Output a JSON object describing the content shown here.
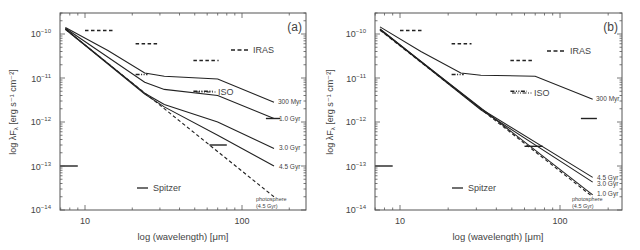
{
  "chart_data": [
    {
      "type": "line",
      "panel_label": "(a)",
      "title": "",
      "xlabel": "log (wavelength) [μm]",
      "ylabel": "log λF_λ [erg s⁻¹ cm⁻²]",
      "xscale": "log",
      "yscale": "log",
      "xlim": [
        6.9,
        256
      ],
      "ylim": [
        1e-14,
        3e-10
      ],
      "x_ticks": [
        {
          "value": 10,
          "label": "10"
        },
        {
          "value": 100,
          "label": "100"
        }
      ],
      "y_ticks": [
        {
          "value": 1e-10,
          "label": "10⁻¹⁰"
        },
        {
          "value": 1e-11,
          "label": "10⁻¹¹"
        },
        {
          "value": 1e-12,
          "label": "10⁻¹²"
        },
        {
          "value": 1e-13,
          "label": "10⁻¹³"
        },
        {
          "value": 1e-14,
          "label": "10⁻¹⁴"
        }
      ],
      "grid": false,
      "series": [
        {
          "name": "300 Myr",
          "style": "solid",
          "x": [
            7.5,
            14,
            24,
            32,
            70,
            160
          ],
          "y": [
            1.4e-10,
            4.2e-11,
            1.3e-11,
            1.1e-11,
            9.5e-12,
            2.8e-12
          ]
        },
        {
          "name": "1.0 Gyr",
          "style": "solid",
          "x": [
            7.5,
            24,
            32,
            70,
            160
          ],
          "y": [
            1.35e-10,
            8e-12,
            5.5e-12,
            4e-12,
            1.2e-12
          ]
        },
        {
          "name": "3.0 Gyr",
          "style": "solid",
          "x": [
            7.5,
            24,
            32,
            70,
            160
          ],
          "y": [
            1.3e-10,
            4.5e-12,
            2.5e-12,
            1e-12,
            2.5e-13
          ]
        },
        {
          "name": "4.5 Gyr",
          "style": "solid",
          "x": [
            7.5,
            24,
            32,
            70,
            160
          ],
          "y": [
            1.28e-10,
            4.3e-12,
            2.2e-12,
            5e-13,
            1e-13
          ]
        },
        {
          "name": "photosphere (4.5 Gyr)",
          "style": "dashed",
          "x": [
            7.5,
            160
          ],
          "y": [
            1.28e-10,
            2e-14
          ]
        }
      ],
      "observations": [
        {
          "instrument": "IRAS",
          "style": "dashed",
          "x_range": [
            10,
            15
          ],
          "y": 1.2e-10
        },
        {
          "instrument": "IRAS",
          "style": "dashed",
          "x_range": [
            21,
            29
          ],
          "y": 6e-11
        },
        {
          "instrument": "IRAS",
          "style": "dashed",
          "x_range": [
            49,
            71
          ],
          "y": 2.5e-11
        },
        {
          "instrument": "ISO",
          "style": "dash-dot-dot",
          "x_range": [
            21,
            25
          ],
          "y": 1.2e-11
        },
        {
          "instrument": "ISO",
          "style": "dash-dot-dot",
          "x_range": [
            49,
            65
          ],
          "y": 5e-12
        },
        {
          "instrument": "Spitzer",
          "style": "solid",
          "x_range": [
            6.9,
            9
          ],
          "y": 1e-13
        },
        {
          "instrument": "Spitzer",
          "style": "solid",
          "x_range": [
            62,
            80
          ],
          "y": 3e-13
        },
        {
          "instrument": "Spitzer",
          "style": "solid",
          "x_range": [
            142,
            175
          ],
          "y": 1.2e-12
        }
      ],
      "legend": [
        {
          "label": "IRAS",
          "style": "dashed"
        },
        {
          "label": "ISO",
          "style": "dash-dot-dot"
        },
        {
          "label": "Spitzer",
          "style": "solid"
        }
      ],
      "curve_labels": [
        "300 Myr",
        "1.0 Gyr",
        "3.0 Gyr",
        "4.5 Gyr",
        "photosphere",
        "(4.5 Gyr)"
      ]
    },
    {
      "type": "line",
      "panel_label": "(b)",
      "title": "",
      "xlabel": "log (wavelength) [μm]",
      "ylabel": "log λF_λ [erg s⁻¹ cm⁻²]",
      "xscale": "log",
      "yscale": "log",
      "xlim": [
        6.9,
        260
      ],
      "ylim": [
        1e-14,
        3e-10
      ],
      "x_ticks": [
        {
          "value": 10,
          "label": "10"
        },
        {
          "value": 100,
          "label": "100"
        }
      ],
      "y_ticks": [
        {
          "value": 1e-10,
          "label": "10⁻¹⁰"
        },
        {
          "value": 1e-11,
          "label": "10⁻¹¹"
        },
        {
          "value": 1e-12,
          "label": "10⁻¹²"
        },
        {
          "value": 1e-13,
          "label": "10⁻¹³"
        },
        {
          "value": 1e-14,
          "label": "10⁻¹⁴"
        }
      ],
      "grid": false,
      "series": [
        {
          "name": "300 Myr",
          "style": "solid",
          "x": [
            7.5,
            13.5,
            24,
            32,
            70,
            160
          ],
          "y": [
            1.45e-10,
            4e-11,
            1.3e-11,
            1.15e-11,
            1.1e-11,
            3.3e-12
          ]
        },
        {
          "name": "4.5 Gyr",
          "style": "solid",
          "x": [
            7.5,
            32,
            160
          ],
          "y": [
            1.3e-10,
            2e-12,
            5.5e-14
          ]
        },
        {
          "name": "3.0 Gyr",
          "style": "solid",
          "x": [
            7.5,
            32,
            160
          ],
          "y": [
            1.28e-10,
            1.9e-12,
            4.3e-14
          ]
        },
        {
          "name": "1.0 Gyr",
          "style": "solid",
          "x": [
            7.5,
            160
          ],
          "y": [
            1.25e-10,
            2.2e-14
          ]
        },
        {
          "name": "photosphere (4.5 Gyr)",
          "style": "dashed",
          "x": [
            7.5,
            160
          ],
          "y": [
            1.22e-10,
            2e-14
          ]
        }
      ],
      "observations": [
        {
          "instrument": "IRAS",
          "style": "dashed",
          "x_range": [
            10,
            14
          ],
          "y": 1.2e-10
        },
        {
          "instrument": "IRAS",
          "style": "dashed",
          "x_range": [
            21,
            28
          ],
          "y": 6e-11
        },
        {
          "instrument": "IRAS",
          "style": "dashed",
          "x_range": [
            49,
            68
          ],
          "y": 2.5e-11
        },
        {
          "instrument": "ISO",
          "style": "dash-dot-dot",
          "x_range": [
            21,
            25
          ],
          "y": 1.2e-11
        },
        {
          "instrument": "ISO",
          "style": "dash-dot-dot",
          "x_range": [
            49,
            62
          ],
          "y": 5e-12
        },
        {
          "instrument": "Spitzer",
          "style": "solid",
          "x_range": [
            6.9,
            9
          ],
          "y": 1e-13
        },
        {
          "instrument": "Spitzer",
          "style": "solid",
          "x_range": [
            60,
            78
          ],
          "y": 2.8e-13
        },
        {
          "instrument": "Spitzer",
          "style": "solid",
          "x_range": [
            135,
            170
          ],
          "y": 1.2e-12
        }
      ],
      "legend": [
        {
          "label": "IRAS",
          "style": "dashed"
        },
        {
          "label": "ISO",
          "style": "dash-dot-dot"
        },
        {
          "label": "Spitzer",
          "style": "solid"
        }
      ],
      "curve_labels": [
        "300 Myr",
        "4.5 Gyr",
        "3.0 Gyr",
        "1.0 Gyr",
        "photosphere",
        "(4.5 Gyr)"
      ]
    }
  ],
  "panels": {
    "a": {
      "label": "(a)",
      "xlabel": "log (wavelength) [μm]",
      "ylabel": "log λF",
      "ylabel_sub": "λ",
      "ylabel_units": " [erg s⁻¹ cm⁻²]",
      "xticks": [
        "10",
        "100"
      ],
      "yticks": [
        "10",
        "10",
        "10",
        "10",
        "10"
      ],
      "yexp": [
        "−10",
        "−11",
        "−12",
        "−13",
        "−14"
      ],
      "legend": {
        "iras": "IRAS",
        "iso": "ISO",
        "spitzer": "Spitzer"
      },
      "labels": {
        "l300": "300 Myr",
        "l1": "1.0 Gyr",
        "l3": "3.0 Gyr",
        "l45": "4.5 Gyr",
        "photo1": "photosphere",
        "photo2": "(4.5 Gyr)"
      }
    },
    "b": {
      "label": "(b)",
      "xlabel": "log (wavelength) [μm]",
      "ylabel": "log λF",
      "ylabel_sub": "λ",
      "ylabel_units": " [erg s⁻¹ cm⁻²]",
      "xticks": [
        "10",
        "100"
      ],
      "yticks": [
        "10",
        "10",
        "10",
        "10",
        "10"
      ],
      "yexp": [
        "−10",
        "−11",
        "−12",
        "−13",
        "−14"
      ],
      "legend": {
        "iras": "IRAS",
        "iso": "ISO",
        "spitzer": "Spitzer"
      },
      "labels": {
        "l300": "300 Myr",
        "l45": "4.5 Gyr",
        "l3": "3.0 Gyr",
        "l1": "1.0 Gyr",
        "photo1": "photosphere",
        "photo2": "(4.5 Gyr)"
      }
    }
  },
  "colors": {
    "line": "#222222",
    "axis": "#555555",
    "text": "#444444"
  }
}
